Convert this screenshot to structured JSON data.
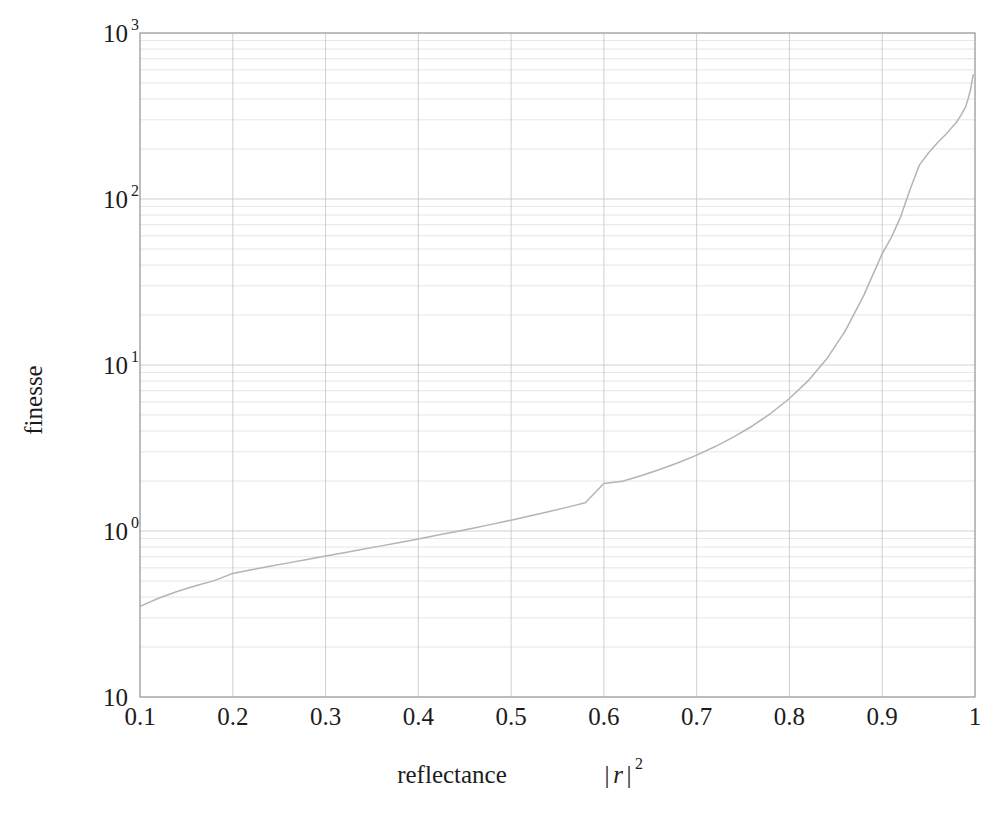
{
  "chart_data": {
    "type": "line",
    "title": "",
    "xlabel": "reflectance  |r|²",
    "xlabel_text": "reflectance",
    "xlabel_symbol": "r",
    "xlabel_symbol_exp": "2",
    "ylabel": "finesse",
    "xscale": "linear",
    "yscale": "log",
    "xlim": [
      0.1,
      1.0
    ],
    "ylim": [
      0.1,
      1000
    ],
    "grid": true,
    "grid_minor": true,
    "legend": "none",
    "line_color": "#b4b4b4",
    "grid_color": "#c8c8c8",
    "axis_color": "#9a9a9a",
    "background": "#ffffff",
    "xticks": [
      0.1,
      0.2,
      0.3,
      0.4,
      0.5,
      0.6,
      0.7,
      0.8,
      0.9,
      1
    ],
    "xtick_labels": [
      "0.1",
      "0.2",
      "0.3",
      "0.4",
      "0.5",
      "0.6",
      "0.7",
      "0.8",
      "0.9",
      "1"
    ],
    "yticks": [
      0.1,
      1,
      10,
      100,
      1000
    ],
    "ytick_labels": [
      "10",
      "10⁰",
      "10¹",
      "10²",
      "10³"
    ],
    "ytick_mantissa": [
      "10",
      "10",
      "10",
      "10",
      "10"
    ],
    "ytick_exponents": [
      "",
      "0",
      "1",
      "2",
      "3"
    ],
    "series": [
      {
        "name": "finesse",
        "formula": "F = pi*sqrt(R)/(1-R)",
        "x": [
          0.1,
          0.12,
          0.14,
          0.16,
          0.18,
          0.2,
          0.22,
          0.24,
          0.26,
          0.28,
          0.3,
          0.32,
          0.34,
          0.36,
          0.38,
          0.4,
          0.42,
          0.44,
          0.46,
          0.48,
          0.5,
          0.52,
          0.54,
          0.56,
          0.58,
          0.6,
          0.62,
          0.64,
          0.66,
          0.68,
          0.7,
          0.72,
          0.74,
          0.76,
          0.78,
          0.8,
          0.82,
          0.84,
          0.86,
          0.88,
          0.9,
          0.91,
          0.92,
          0.93,
          0.94,
          0.95,
          0.96,
          0.97,
          0.975,
          0.98,
          0.985,
          0.99,
          0.9925,
          0.995,
          0.9965,
          0.998
        ],
        "y": [
          0.3513,
          0.3936,
          0.4322,
          0.4683,
          0.5026,
          0.5554,
          0.5837,
          0.6127,
          0.6427,
          0.6738,
          0.7062,
          0.7402,
          0.7759,
          0.8136,
          0.8536,
          0.8961,
          0.9416,
          0.9905,
          1.0432,
          1.1003,
          1.1624,
          1.2304,
          1.3052,
          1.388,
          1.4803,
          1.9354,
          1.9926,
          2.1527,
          2.3451,
          2.579,
          2.8667,
          3.2265,
          3.6867,
          4.2921,
          5.1196,
          6.2832,
          8.0214,
          10.86,
          15.9968,
          26.16,
          46.87,
          58.9,
          78.6,
          114.0,
          160.0,
          190.0,
          220.0,
          250.0,
          270.0,
          290.0,
          320.0,
          360.0,
          400.0,
          450.0,
          500.0,
          560.0
        ]
      }
    ]
  },
  "plot_geometry": {
    "left": 140,
    "right": 975,
    "top": 33,
    "bottom": 697
  }
}
